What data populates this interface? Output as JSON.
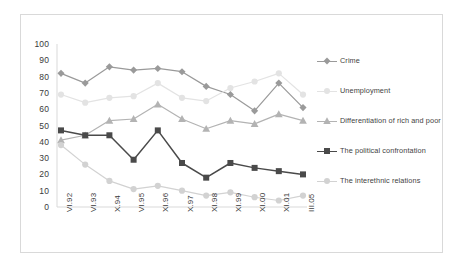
{
  "chart_data": {
    "type": "line",
    "title": "",
    "subtitle": "",
    "xlabel": "",
    "ylabel": "",
    "ylim": [
      0,
      100
    ],
    "ytick_step": 10,
    "yticks": [
      "100",
      "90",
      "80",
      "70",
      "60",
      "50",
      "40",
      "30",
      "20",
      "10",
      "0"
    ],
    "grid": false,
    "legend_position": "right",
    "categories": [
      "VI.92",
      "VI.93",
      "X.94",
      "VI.95",
      "XI.96",
      "X.97",
      "XI.98",
      "XI.99",
      "XI.00",
      "XI.01",
      "III.05"
    ],
    "series": [
      {
        "name": "Crime",
        "color": "#9a9a9a",
        "marker": "diamond",
        "values": [
          82,
          76,
          86,
          84,
          85,
          83,
          74,
          69,
          59,
          76,
          61
        ]
      },
      {
        "name": "Unemployment",
        "color": "#e3e3e3",
        "marker": "circle",
        "values": [
          69,
          64,
          67,
          68,
          76,
          67,
          65,
          73,
          77,
          82,
          69
        ]
      },
      {
        "name": "Differentiation of rich and poor",
        "color": "#b3b3b3",
        "marker": "triangle",
        "values": [
          41,
          44,
          53,
          54,
          63,
          54,
          48,
          53,
          51,
          57,
          53
        ]
      },
      {
        "name": "The political confrontation",
        "color": "#4a4a4a",
        "marker": "square",
        "values": [
          47,
          44,
          44,
          29,
          47,
          27,
          18,
          27,
          24,
          22,
          20
        ]
      },
      {
        "name": "The interethnic relations",
        "color": "#d2d2d2",
        "marker": "circle",
        "values": [
          38,
          26,
          16,
          11,
          13,
          10,
          7,
          9,
          6,
          4,
          7
        ]
      }
    ]
  },
  "legend": {
    "items": [
      {
        "label": "Crime"
      },
      {
        "label": "Unemployment"
      },
      {
        "label": "Differentiation of rich and poor"
      },
      {
        "label": "The political confrontation"
      },
      {
        "label": "The interethnic relations"
      }
    ]
  },
  "colors": {
    "border": "#d9d9d9",
    "axis": "#d9d9d9",
    "text": "#3a3a3a",
    "background": "#ffffff"
  }
}
